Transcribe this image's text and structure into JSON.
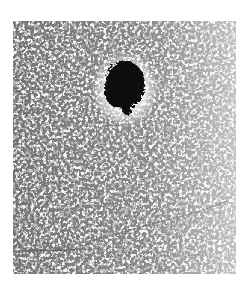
{
  "image": {
    "kind": "micrograph",
    "description": "Grayscale light-microscopy field of densely packed small rounded cells with a single dark, irregular cluster in the upper center and faint fiber strands near the bottom",
    "background_color": "#ffffff",
    "field_color": "#f4f4f4",
    "cell_outline_color": "#6a6a6a",
    "cluster_color": "#0a0a0a",
    "field_bounds": {
      "x": 13,
      "y": 21,
      "width": 223,
      "height": 253
    },
    "cluster_center": {
      "x": 125,
      "y": 87
    },
    "cluster_size": {
      "width": 42,
      "height": 56
    }
  }
}
